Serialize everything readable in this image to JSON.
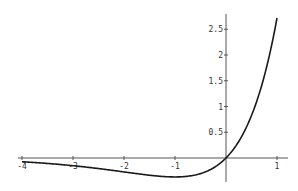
{
  "chart_data": {
    "type": "line",
    "title": "",
    "xlabel": "",
    "ylabel": "",
    "function": "x*exp(x)",
    "xlim": [
      -4.05,
      1.05
    ],
    "ylim": [
      -0.45,
      2.8
    ],
    "grid": false,
    "legend": null,
    "x_ticks": [
      -4,
      -3,
      -2,
      -1,
      1
    ],
    "x_tick_labels": [
      "-4",
      "-3",
      "-2",
      "-1",
      "1"
    ],
    "y_ticks": [
      0.5,
      1,
      1.5,
      2,
      2.5
    ],
    "y_tick_labels": [
      "0.5",
      "1",
      "1.5",
      "2",
      "2.5"
    ],
    "series": [
      {
        "name": "x e^x",
        "x": [
          -4,
          -3.5,
          -3,
          -2.5,
          -2,
          -1.5,
          -1,
          -0.5,
          0,
          0.25,
          0.5,
          0.75,
          1
        ],
        "values": [
          -0.073,
          -0.106,
          -0.149,
          -0.205,
          -0.271,
          -0.335,
          -0.368,
          -0.303,
          0,
          0.321,
          0.824,
          1.588,
          2.718
        ]
      }
    ],
    "colors": {
      "line": "#1a1a1a",
      "axes": "#555555"
    }
  }
}
